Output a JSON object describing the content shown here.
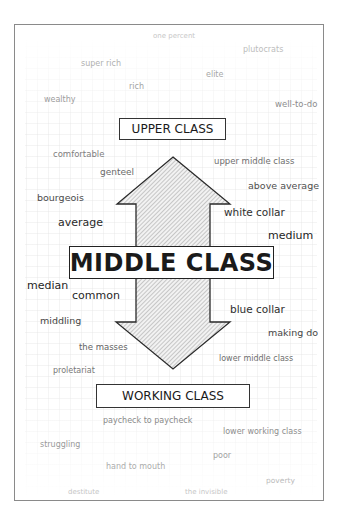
{
  "diagram": {
    "title": "MIDDLE CLASS",
    "upper_label": "UPPER CLASS",
    "lower_label": "WORKING CLASS",
    "arrow": "double-headed vertical arrow (hatched) connecting upper class and working class through middle class",
    "colors": {
      "border": "#333333",
      "frame": "#8a8a8a",
      "grid": "#e2e2e2",
      "hatch": "#9a9a9a"
    },
    "words": [
      {
        "text": "one percent",
        "x": 153,
        "y": 39,
        "size": 7,
        "color": "#c8c8c8"
      },
      {
        "text": "plutocrats",
        "x": 243,
        "y": 52,
        "size": 8,
        "color": "#bdbdbd"
      },
      {
        "text": "super rich",
        "x": 81,
        "y": 66,
        "size": 8,
        "color": "#b0b0b0"
      },
      {
        "text": "elite",
        "x": 206,
        "y": 77,
        "size": 8,
        "color": "#a8a8a8"
      },
      {
        "text": "rich",
        "x": 129,
        "y": 89,
        "size": 8,
        "color": "#a3a3a3"
      },
      {
        "text": "wealthy",
        "x": 44,
        "y": 102,
        "size": 8,
        "color": "#9d9d9d"
      },
      {
        "text": "well-to-do",
        "x": 275,
        "y": 107,
        "size": 8.5,
        "color": "#8c8c8c"
      },
      {
        "text": "comfortable",
        "x": 53,
        "y": 157,
        "size": 8.5,
        "color": "#7e7e7e"
      },
      {
        "text": "upper middle class",
        "x": 214,
        "y": 164,
        "size": 8.5,
        "color": "#6e6e6e"
      },
      {
        "text": "genteel",
        "x": 100,
        "y": 175,
        "size": 9,
        "color": "#6a6a6a"
      },
      {
        "text": "above average",
        "x": 248,
        "y": 189,
        "size": 9.5,
        "color": "#4e4e4e"
      },
      {
        "text": "bourgeois",
        "x": 37,
        "y": 201,
        "size": 9.5,
        "color": "#4a4a4a"
      },
      {
        "text": "white collar",
        "x": 224,
        "y": 215,
        "size": 10.5,
        "color": "#2e2e2e"
      },
      {
        "text": "average",
        "x": 58,
        "y": 226,
        "size": 11,
        "color": "#2a2a2a"
      },
      {
        "text": "medium",
        "x": 268,
        "y": 239,
        "size": 11,
        "color": "#1e1e1e"
      },
      {
        "text": "median",
        "x": 27,
        "y": 289,
        "size": 11,
        "color": "#1e1e1e"
      },
      {
        "text": "common",
        "x": 72,
        "y": 299,
        "size": 11,
        "color": "#262626"
      },
      {
        "text": "blue collar",
        "x": 230,
        "y": 312,
        "size": 10.5,
        "color": "#2e2e2e"
      },
      {
        "text": "middling",
        "x": 40,
        "y": 324,
        "size": 9.5,
        "color": "#464646"
      },
      {
        "text": "making do",
        "x": 268,
        "y": 336,
        "size": 9.5,
        "color": "#464646"
      },
      {
        "text": "the masses",
        "x": 79,
        "y": 350,
        "size": 8.5,
        "color": "#626262"
      },
      {
        "text": "lower middle class",
        "x": 219,
        "y": 361,
        "size": 8,
        "color": "#6e6e6e"
      },
      {
        "text": "proletariat",
        "x": 53,
        "y": 373,
        "size": 8,
        "color": "#787878"
      },
      {
        "text": "paycheck to paycheck",
        "x": 103,
        "y": 423,
        "size": 8,
        "color": "#8a8a8a"
      },
      {
        "text": "lower working class",
        "x": 223,
        "y": 434,
        "size": 8,
        "color": "#8e8e8e"
      },
      {
        "text": "struggling",
        "x": 40,
        "y": 447,
        "size": 8,
        "color": "#9a9a9a"
      },
      {
        "text": "poor",
        "x": 213,
        "y": 458,
        "size": 8,
        "color": "#a2a2a2"
      },
      {
        "text": "hand to mouth",
        "x": 106,
        "y": 469,
        "size": 8,
        "color": "#acacac"
      },
      {
        "text": "poverty",
        "x": 266,
        "y": 483,
        "size": 7.5,
        "color": "#bbbbbb"
      },
      {
        "text": "destitute",
        "x": 68,
        "y": 495,
        "size": 7,
        "color": "#c6c6c6"
      },
      {
        "text": "the invisible",
        "x": 185,
        "y": 495,
        "size": 7,
        "color": "#c6c6c6"
      }
    ]
  }
}
